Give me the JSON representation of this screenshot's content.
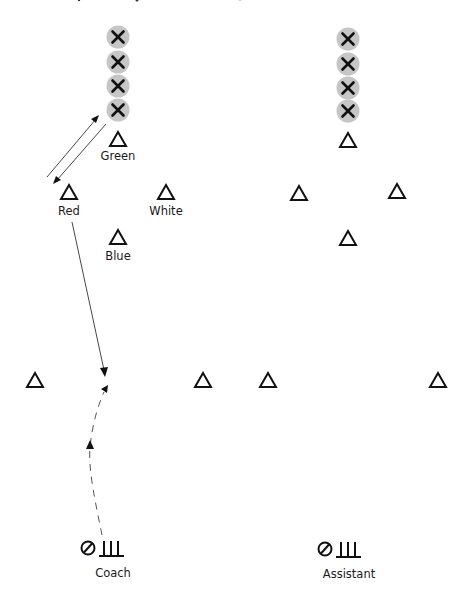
{
  "diagram": {
    "colors": {
      "player_disc": "#c6c6c6",
      "stroke": "#111111",
      "text": "#1a1a1a"
    },
    "left_drill": {
      "players_queue": [
        {
          "icon": "x-player-icon",
          "x": 118,
          "y": 37
        },
        {
          "icon": "x-player-icon",
          "x": 118,
          "y": 62
        },
        {
          "icon": "x-player-icon",
          "x": 118,
          "y": 86
        },
        {
          "icon": "x-player-icon",
          "x": 118,
          "y": 110
        }
      ],
      "cones": [
        {
          "name": "green",
          "label": "Green",
          "x": 118,
          "y": 140
        },
        {
          "name": "red",
          "label": "Red",
          "x": 69,
          "y": 192
        },
        {
          "name": "white",
          "label": "White",
          "x": 166,
          "y": 192
        },
        {
          "name": "blue",
          "label": "Blue",
          "x": 118,
          "y": 237
        },
        {
          "name": "mid-left",
          "label": "",
          "x": 35,
          "y": 380
        },
        {
          "name": "mid-right",
          "label": "",
          "x": 203,
          "y": 380
        }
      ],
      "staff": {
        "label": "Coach",
        "ball_icon": "ball-icon",
        "goal_icon": "mini-goal-icon"
      }
    },
    "right_drill": {
      "players_queue": [
        {
          "icon": "x-player-icon",
          "x": 348,
          "y": 39
        },
        {
          "icon": "x-player-icon",
          "x": 348,
          "y": 64
        },
        {
          "icon": "x-player-icon",
          "x": 348,
          "y": 88
        },
        {
          "icon": "x-player-icon",
          "x": 348,
          "y": 111
        }
      ],
      "cones": [
        {
          "name": "top",
          "label": "",
          "x": 348,
          "y": 140
        },
        {
          "name": "left",
          "label": "",
          "x": 299,
          "y": 193
        },
        {
          "name": "right",
          "label": "",
          "x": 397,
          "y": 191
        },
        {
          "name": "bottom",
          "label": "",
          "x": 348,
          "y": 238
        },
        {
          "name": "mid-left",
          "label": "",
          "x": 268,
          "y": 380
        },
        {
          "name": "mid-right",
          "label": "",
          "x": 438,
          "y": 380
        }
      ],
      "staff": {
        "label": "Assistant",
        "ball_icon": "ball-icon",
        "goal_icon": "mini-goal-icon"
      }
    },
    "paths": [
      {
        "type": "pass",
        "style": "solid",
        "from": "red",
        "to": "player-queue",
        "arrow": "end"
      },
      {
        "type": "pass",
        "style": "solid",
        "from": "player-queue",
        "to": "red",
        "arrow": "end"
      },
      {
        "type": "run",
        "style": "solid",
        "from": "red",
        "to": "midfield",
        "arrow": "end"
      },
      {
        "type": "dribble",
        "style": "dashed",
        "from": "coach",
        "to": "midfield",
        "arrow": "mid-and-end"
      }
    ]
  }
}
